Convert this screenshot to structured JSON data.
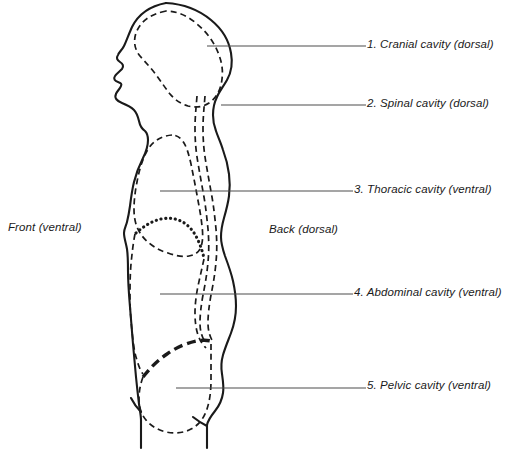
{
  "diagram": {
    "orientation_labels": {
      "front": "Front (ventral)",
      "back": "Back (dorsal)"
    },
    "colors": {
      "ink": "#1a1a1a",
      "leader": "#4d4d4d",
      "background": "#ffffff"
    },
    "cavities": [
      {
        "number": "1.",
        "label": "1. Cranial cavity (dorsal)",
        "name": "Cranial cavity",
        "group": "dorsal",
        "line_style": "dashed"
      },
      {
        "number": "2.",
        "label": "2. Spinal cavity (dorsal)",
        "name": "Spinal cavity",
        "group": "dorsal",
        "line_style": "dashed"
      },
      {
        "number": "3.",
        "label": "3. Thoracic cavity (ventral)",
        "name": "Thoracic cavity",
        "group": "ventral",
        "line_style": "dashed"
      },
      {
        "number": "4.",
        "label": "4. Abdominal cavity (ventral)",
        "name": "Abdominal cavity",
        "group": "ventral",
        "line_style": "dashed"
      },
      {
        "number": "5.",
        "label": "5. Pelvic cavity (ventral)",
        "name": "Pelvic cavity",
        "group": "ventral",
        "line_style": "dashed"
      }
    ],
    "dividers": [
      {
        "name": "diaphragm",
        "between": "thoracic / abdominal",
        "line_style": "dotted"
      },
      {
        "name": "pelvic-brim",
        "between": "abdominal / pelvic",
        "line_style": "bold-dashed"
      }
    ]
  }
}
